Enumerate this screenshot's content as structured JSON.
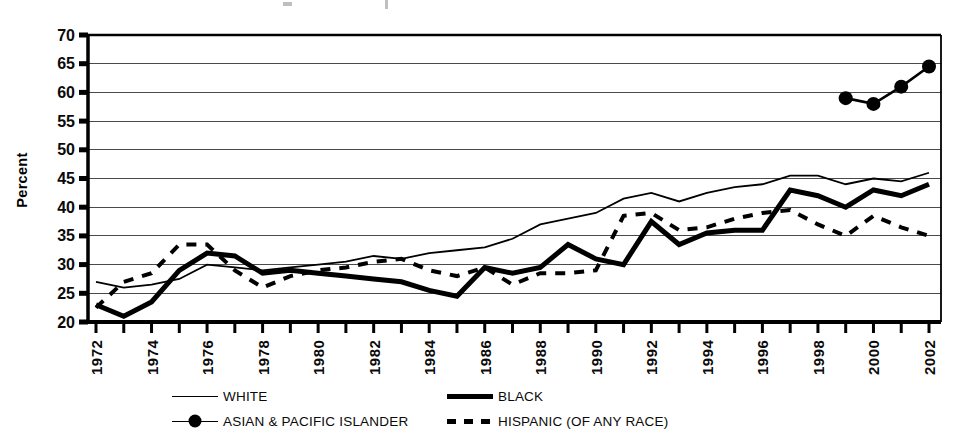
{
  "chart_data": {
    "type": "line",
    "title": "",
    "ylabel": "Percent",
    "xlabel": "",
    "ylim": [
      20,
      70
    ],
    "xlim": [
      1972,
      2002
    ],
    "y_ticks": [
      20,
      25,
      30,
      35,
      40,
      45,
      50,
      55,
      60,
      65,
      70
    ],
    "x_tick_labels": [
      "1972",
      "1974",
      "1976",
      "1978",
      "1980",
      "1982",
      "1984",
      "1986",
      "1988",
      "1990",
      "1992",
      "1994",
      "1996",
      "1998",
      "2000",
      "2002"
    ],
    "grid": "horizontal",
    "legend_position": "bottom",
    "x": [
      1972,
      1973,
      1974,
      1975,
      1976,
      1977,
      1978,
      1979,
      1980,
      1981,
      1982,
      1983,
      1984,
      1985,
      1986,
      1987,
      1988,
      1989,
      1990,
      1991,
      1992,
      1993,
      1994,
      1995,
      1996,
      1997,
      1998,
      1999,
      2000,
      2001,
      2002
    ],
    "series": [
      {
        "name": "WHITE",
        "style": "thin-solid",
        "values": [
          27,
          26,
          26.5,
          27.5,
          30,
          29.5,
          29,
          29.5,
          30,
          30.5,
          31.5,
          31,
          32,
          32.5,
          33,
          34.5,
          37,
          38,
          39,
          41.5,
          42.5,
          41,
          42.5,
          43.5,
          44,
          45.5,
          45.5,
          44,
          45,
          44.5,
          46
        ]
      },
      {
        "name": "BLACK",
        "style": "thick-solid",
        "values": [
          23,
          21,
          23.5,
          29,
          32,
          31.5,
          28.5,
          29,
          28.5,
          28,
          27.5,
          27,
          25.5,
          24.5,
          29.5,
          28.5,
          29.5,
          33.5,
          31,
          30,
          37.5,
          33.5,
          35.5,
          36,
          36,
          43,
          42,
          40,
          43,
          42,
          44
        ]
      },
      {
        "name": "HISPANIC (OF ANY RACE)",
        "style": "thick-dashed",
        "values": [
          22.5,
          27,
          28.5,
          33.5,
          33.5,
          29,
          26,
          28,
          29,
          29.5,
          30.5,
          31,
          29,
          28,
          29.5,
          26.5,
          28.5,
          28.5,
          29,
          38.5,
          39,
          36,
          36.5,
          38,
          39,
          39.5,
          37,
          35,
          38.5,
          36.5,
          35
        ]
      },
      {
        "name": "ASIAN & PACIFIC ISLANDER",
        "style": "line-marker",
        "x": [
          1999,
          2000,
          2001,
          2002
        ],
        "values": [
          59,
          58,
          61,
          64.5
        ]
      }
    ]
  },
  "legend": [
    {
      "label": "WHITE",
      "style": "thin-solid"
    },
    {
      "label": "BLACK",
      "style": "thick-solid"
    },
    {
      "label": "ASIAN & PACIFIC ISLANDER",
      "style": "line-marker"
    },
    {
      "label": "HISPANIC (OF ANY RACE)",
      "style": "thick-dashed"
    }
  ]
}
